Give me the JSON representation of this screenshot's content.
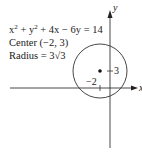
{
  "equation": {
    "x": "x",
    "y": "y",
    "exp": "2",
    "rest": " + 4x − 6y = 14"
  },
  "center_text": "Center (−2, 3)",
  "radius_text": "Radius = 3√3",
  "axes": {
    "x_label": "x",
    "y_label": "y"
  },
  "ticks": {
    "x_tick": "−2",
    "y_tick": "3"
  },
  "circle": {
    "center": [
      -2,
      3
    ],
    "radius": "3√3"
  }
}
